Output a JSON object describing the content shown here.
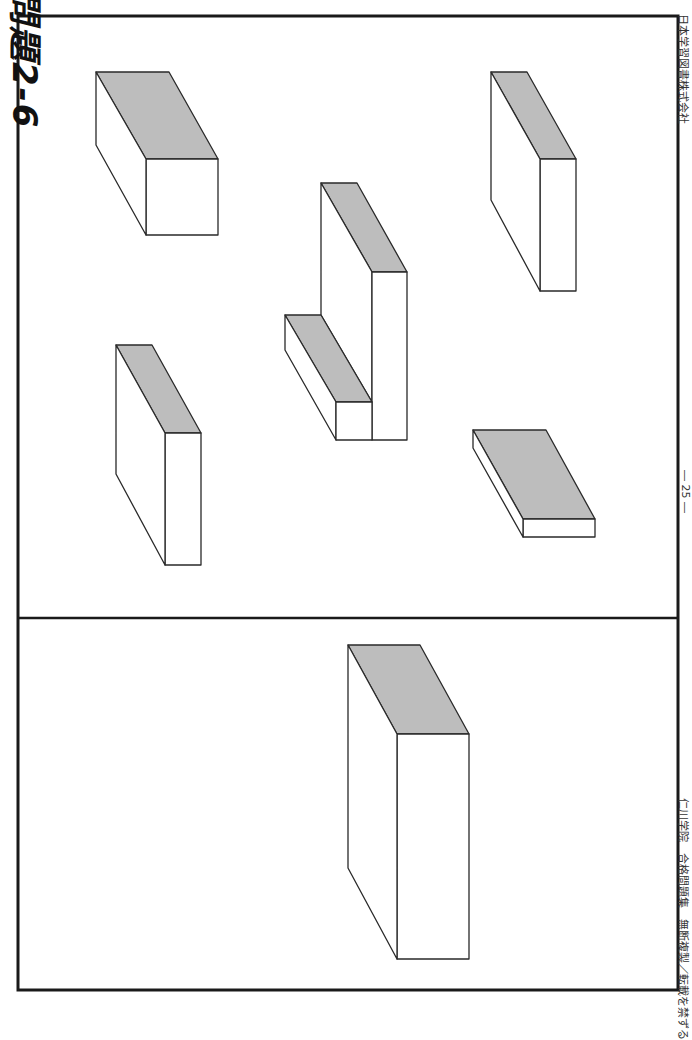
{
  "page": {
    "title": "問題2-6",
    "page_number": "― 25 ―",
    "publisher": "日本学習図書株式会社",
    "copyright": "仁川学院　合格問題集　無断複製／転載を禁ずる"
  },
  "colors": {
    "border": "#1a1a1a",
    "top_face": "#bdbdbd",
    "side_face": "#ffffff",
    "line": "#2a2a2a"
  },
  "figures": {
    "example": {
      "label": "example-block",
      "description": "large rectangular block (bottom panel)"
    },
    "choices": [
      {
        "label": "choice-1",
        "description": "rectangular block, top-left"
      },
      {
        "label": "choice-2",
        "description": "thin slab, left-middle"
      },
      {
        "label": "choice-3",
        "description": "L-shaped block, center"
      },
      {
        "label": "choice-4",
        "description": "thin slab, top-right"
      },
      {
        "label": "choice-5",
        "description": "flat plate, right-middle"
      }
    ]
  }
}
